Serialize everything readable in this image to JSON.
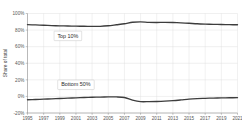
{
  "chart_data": {
    "type": "line",
    "title": "",
    "xlabel": "",
    "ylabel": "Share of total",
    "ylim": [
      -20,
      100
    ],
    "xlim": [
      1995,
      2021
    ],
    "grid": true,
    "legend_position": "inline-annotation",
    "ytick_labels": [
      "100%",
      "80%",
      "60%",
      "40%",
      "20%",
      "0%",
      "-20%"
    ],
    "ytick_values": [
      100,
      80,
      60,
      40,
      20,
      0,
      -20
    ],
    "xtick_labels": [
      "1995",
      "1997",
      "1999",
      "2001",
      "2003",
      "2005",
      "2007",
      "2009",
      "2011",
      "2013",
      "2015",
      "2017",
      "2019",
      "2021"
    ],
    "xtick_values": [
      1995,
      1997,
      1999,
      2001,
      2003,
      2005,
      2007,
      2009,
      2011,
      2013,
      2015,
      2017,
      2019,
      2021
    ],
    "x": [
      1995,
      1996,
      1997,
      1998,
      1999,
      2000,
      2001,
      2002,
      2003,
      2004,
      2005,
      2006,
      2007,
      2008,
      2009,
      2010,
      2011,
      2012,
      2013,
      2014,
      2015,
      2016,
      2017,
      2018,
      2019,
      2020,
      2021
    ],
    "series": [
      {
        "name": "Top 10%",
        "color": "#3d3d3d",
        "annotation": "Top 10%",
        "values": [
          86.5,
          86.2,
          85.8,
          85.4,
          85.1,
          84.9,
          84.7,
          84.6,
          84.4,
          84.5,
          85.2,
          86.4,
          87.6,
          89.4,
          89.9,
          89.3,
          89.2,
          89.3,
          89.1,
          88.7,
          88.2,
          87.6,
          87.2,
          86.9,
          86.7,
          86.5,
          86.4
        ]
      },
      {
        "name": "Bottom 50%",
        "color": "#3d3d3d",
        "annotation": "Bottom 50%",
        "values": [
          -4.0,
          -3.7,
          -3.3,
          -2.9,
          -2.5,
          -2.1,
          -1.7,
          -1.3,
          -1.0,
          -0.8,
          -0.6,
          -0.6,
          -1.3,
          -4.4,
          -6.3,
          -6.3,
          -6.1,
          -5.7,
          -5.1,
          -4.2,
          -3.2,
          -2.6,
          -2.3,
          -2.0,
          -1.8,
          -1.6,
          -1.5
        ]
      }
    ],
    "annotations": [
      {
        "text": "Top 10%",
        "x": 2000,
        "y": 73
      },
      {
        "text": "Bottom 50%",
        "x": 2001,
        "y": 14
      }
    ]
  }
}
